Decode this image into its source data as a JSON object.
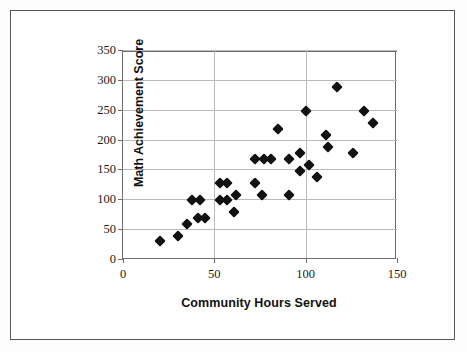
{
  "chart_data": {
    "type": "scatter",
    "title": "",
    "xlabel": "Community Hours Served",
    "ylabel": "Math Achievement Score",
    "xlim": [
      0,
      150
    ],
    "ylim": [
      0,
      350
    ],
    "xticks": [
      0,
      50,
      100,
      150
    ],
    "yticks": [
      0,
      50,
      100,
      150,
      200,
      250,
      300,
      350
    ],
    "xtick_labels": [
      "0",
      "50",
      "100",
      "150"
    ],
    "ytick_labels": [
      "0",
      "50",
      "100",
      "150",
      "200",
      "250",
      "300",
      "350"
    ],
    "grid": "horizontal-and-vertical",
    "legend": "none",
    "marker": "filled-diamond",
    "marker_color": "#111111",
    "points": [
      {
        "x": 20,
        "y": 30
      },
      {
        "x": 30,
        "y": 39
      },
      {
        "x": 35,
        "y": 59
      },
      {
        "x": 41,
        "y": 68
      },
      {
        "x": 38,
        "y": 99
      },
      {
        "x": 42,
        "y": 99
      },
      {
        "x": 45,
        "y": 69
      },
      {
        "x": 53,
        "y": 128
      },
      {
        "x": 57,
        "y": 128
      },
      {
        "x": 53,
        "y": 99
      },
      {
        "x": 57,
        "y": 99
      },
      {
        "x": 62,
        "y": 108
      },
      {
        "x": 61,
        "y": 78
      },
      {
        "x": 72,
        "y": 128
      },
      {
        "x": 76,
        "y": 108
      },
      {
        "x": 72,
        "y": 168
      },
      {
        "x": 77,
        "y": 168
      },
      {
        "x": 81,
        "y": 168
      },
      {
        "x": 85,
        "y": 218
      },
      {
        "x": 91,
        "y": 107
      },
      {
        "x": 91,
        "y": 168
      },
      {
        "x": 97,
        "y": 178
      },
      {
        "x": 97,
        "y": 148
      },
      {
        "x": 100,
        "y": 248
      },
      {
        "x": 102,
        "y": 158
      },
      {
        "x": 106,
        "y": 137
      },
      {
        "x": 111,
        "y": 207
      },
      {
        "x": 112,
        "y": 188
      },
      {
        "x": 117,
        "y": 288
      },
      {
        "x": 126,
        "y": 177
      },
      {
        "x": 132,
        "y": 248
      },
      {
        "x": 137,
        "y": 228
      }
    ]
  },
  "figure": {
    "y_axis_title": "Math Achievement Score",
    "x_axis_title": "Community Hours Served"
  }
}
